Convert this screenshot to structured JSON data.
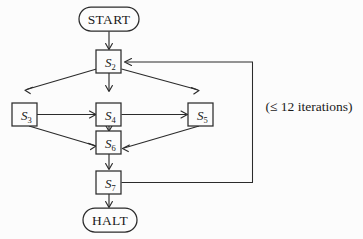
{
  "diagram": {
    "type": "flowchart",
    "title": "",
    "background_color": "#fcfcfc",
    "line_color": "#2b2b2b",
    "text_color": "#1a1a1a",
    "nodes": [
      {
        "id": "start",
        "label": "START",
        "shape": "stadium",
        "x": 109,
        "y": 19,
        "w": 60,
        "h": 24
      },
      {
        "id": "s2",
        "label": "S",
        "sub": "2",
        "shape": "rect",
        "x": 108.5,
        "y": 61,
        "w": 25,
        "h": 23
      },
      {
        "id": "s3",
        "label": "S",
        "sub": "3",
        "shape": "rect",
        "x": 24,
        "y": 103,
        "w": 25,
        "h": 23
      },
      {
        "id": "s4",
        "label": "S",
        "sub": "4",
        "shape": "rect",
        "x": 108.5,
        "y": 103,
        "w": 25,
        "h": 23
      },
      {
        "id": "s5",
        "label": "S",
        "sub": "5",
        "shape": "rect",
        "x": 200,
        "y": 103,
        "w": 25,
        "h": 23
      },
      {
        "id": "s6",
        "label": "S",
        "sub": "6",
        "shape": "rect",
        "x": 108.5,
        "y": 141,
        "w": 25,
        "h": 23
      },
      {
        "id": "s7",
        "label": "S",
        "sub": "7",
        "shape": "rect",
        "x": 108.5,
        "y": 181,
        "w": 25,
        "h": 23
      },
      {
        "id": "halt",
        "label": "HALT",
        "shape": "stadium",
        "x": 110,
        "y": 220,
        "w": 54,
        "h": 24
      }
    ],
    "edges": [
      {
        "from": "start",
        "to": "s2",
        "kind": "straight-down"
      },
      {
        "from": "s2",
        "to": "s3",
        "kind": "diagonal-left-down"
      },
      {
        "from": "s2",
        "to": "s4",
        "kind": "straight-down"
      },
      {
        "from": "s2",
        "to": "s5",
        "kind": "diagonal-right-down"
      },
      {
        "from": "s3",
        "to": "s4",
        "kind": "horizontal-right"
      },
      {
        "from": "s4",
        "to": "s5",
        "kind": "horizontal-right"
      },
      {
        "from": "s3",
        "to": "s6",
        "kind": "diagonal-right-down"
      },
      {
        "from": "s4",
        "to": "s6",
        "kind": "straight-down"
      },
      {
        "from": "s5",
        "to": "s6",
        "kind": "diagonal-left-down"
      },
      {
        "from": "s6",
        "to": "s7",
        "kind": "straight-down"
      },
      {
        "from": "s7",
        "to": "halt",
        "kind": "straight-down"
      },
      {
        "from": "s7",
        "to": "s2",
        "kind": "feedback-loop-right",
        "annotation": "(≤ 12 iterations)"
      }
    ],
    "annotations": [
      {
        "id": "iterations-note",
        "text": "(≤ 12 iterations)",
        "x": 309,
        "y": 106
      }
    ]
  }
}
